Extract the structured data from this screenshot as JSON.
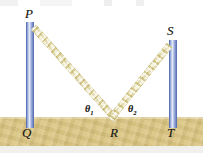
{
  "figure": {
    "ground_label": "sand",
    "colors": {
      "sand": "#d9c37e",
      "beam": "#e9e2ad",
      "pole": "#8fa3d6",
      "label_text": "#201c16",
      "background": "#ffffff"
    }
  },
  "points": {
    "p": "P",
    "q": "Q",
    "r": "R",
    "s": "S",
    "t": "T"
  },
  "angles": {
    "theta1": {
      "symbol": "θ",
      "subscript": "1"
    },
    "theta2": {
      "symbol": "θ",
      "subscript": "2"
    }
  }
}
